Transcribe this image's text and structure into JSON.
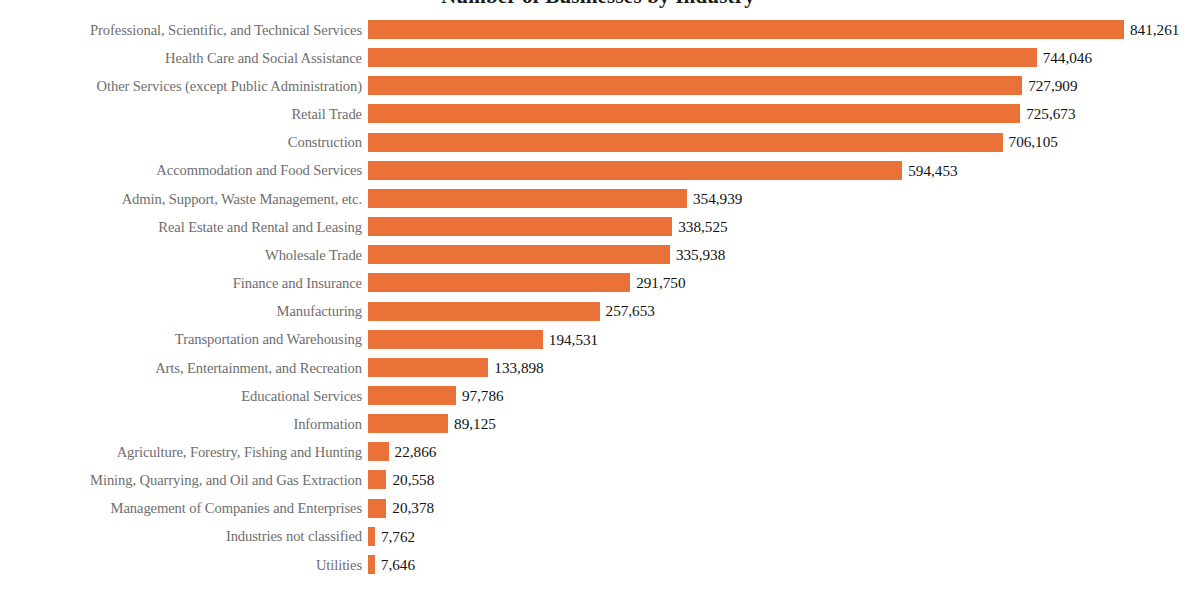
{
  "chart_data": {
    "type": "bar",
    "orientation": "horizontal",
    "title": "Number of Businesses by Industry",
    "xlabel": "",
    "ylabel": "",
    "grid": false,
    "legend": "none",
    "xlim": [
      0,
      841261
    ],
    "bar_color": "#ea7138",
    "label_color": "#6e6e6e",
    "value_color": "#111111",
    "categories": [
      "Professional, Scientific, and Technical Services",
      "Health Care and Social Assistance",
      "Other Services (except Public Administration)",
      "Retail Trade",
      "Construction",
      "Accommodation and Food Services",
      "Admin, Support, Waste Management, etc.",
      "Real Estate and Rental and Leasing",
      "Wholesale Trade",
      "Finance and Insurance",
      "Manufacturing",
      "Transportation and Warehousing",
      "Arts, Entertainment, and Recreation",
      "Educational Services",
      "Information",
      "Agriculture, Forestry, Fishing and Hunting",
      "Mining, Quarrying, and Oil and Gas Extraction",
      "Management of Companies and Enterprises",
      "Industries not classified",
      "Utilities"
    ],
    "values": [
      841261,
      744046,
      727909,
      725673,
      706105,
      594453,
      354939,
      338525,
      335938,
      291750,
      257653,
      194531,
      133898,
      97786,
      89125,
      22866,
      20558,
      20378,
      7762,
      7646
    ],
    "value_labels": [
      "841,261",
      "744,046",
      "727,909",
      "725,673",
      "706,105",
      "594,453",
      "354,939",
      "338,525",
      "335,938",
      "291,750",
      "257,653",
      "194,531",
      "133,898",
      "97,786",
      "89,125",
      "22,866",
      "20,558",
      "20,378",
      "7,762",
      "7,646"
    ]
  }
}
